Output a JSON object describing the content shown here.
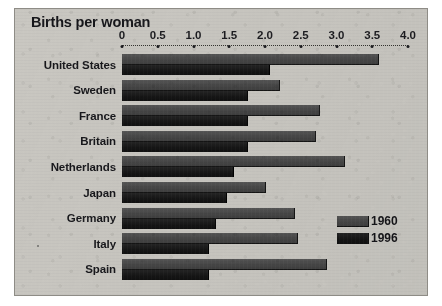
{
  "chart_data": {
    "type": "bar",
    "orientation": "horizontal",
    "title": "Births per woman",
    "xlabel": "",
    "ylabel": "",
    "xlim": [
      0,
      4.0
    ],
    "xticks": [
      "0",
      "0.5",
      "1.0",
      "1.5",
      "2.0",
      "2.5",
      "3.0",
      "3.5",
      "4.0"
    ],
    "xtick_values": [
      0,
      0.5,
      1.0,
      1.5,
      2.0,
      2.5,
      3.0,
      3.5,
      4.0
    ],
    "grid": false,
    "legend_position": "bottom-right",
    "categories": [
      "United States",
      "Sweden",
      "France",
      "Britain",
      "Netherlands",
      "Japan",
      "Germany",
      "Italy",
      "Spain"
    ],
    "series": [
      {
        "name": "1960",
        "color": "#4b4b4b",
        "values": [
          3.58,
          2.2,
          2.75,
          2.7,
          3.1,
          2.0,
          2.4,
          2.45,
          2.85
        ]
      },
      {
        "name": "1996",
        "color": "#1b1b1b",
        "values": [
          2.05,
          1.75,
          1.75,
          1.75,
          1.55,
          1.45,
          1.3,
          1.2,
          1.2
        ]
      }
    ]
  },
  "legend": {
    "entries": [
      {
        "label": "1960",
        "swatch": "s1960"
      },
      {
        "label": "1996",
        "swatch": "s1996"
      }
    ]
  },
  "colors": {
    "background": "#c9c7c1",
    "border": "#8e8c86",
    "series_1960": "#4b4b4b",
    "series_1996": "#1b1b1b",
    "text": "#17171b"
  }
}
